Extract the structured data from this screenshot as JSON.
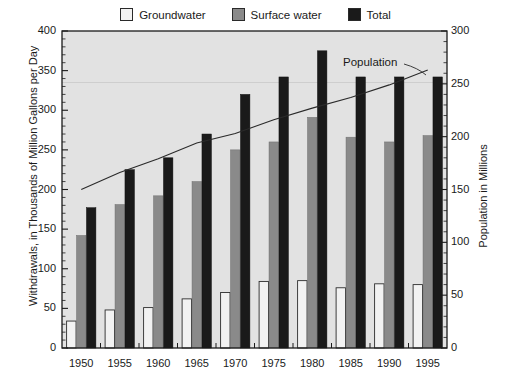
{
  "chart_data": {
    "type": "bar",
    "title": "",
    "subtitle": "",
    "xlabel": "",
    "ylabel": "Withdrawals, in Thousands of Million Gallons per Day",
    "y2label": "Population in Millions",
    "categories": [
      "1950",
      "1955",
      "1960",
      "1965",
      "1970",
      "1975",
      "1980",
      "1985",
      "1990",
      "1995"
    ],
    "ylim": [
      0,
      400
    ],
    "y2lim": [
      0,
      300
    ],
    "yticks": [
      0,
      50,
      100,
      150,
      200,
      250,
      300,
      350,
      400
    ],
    "y2ticks": [
      0,
      50,
      100,
      150,
      200,
      250,
      300
    ],
    "yminor_step": 10,
    "grid": "single faint horizontal line at y=335 (left axis)",
    "legend_position": "top-center",
    "plot_background": "#e2e2e2",
    "series": [
      {
        "name": "Groundwater",
        "axis": "left",
        "type": "bar",
        "color": "#f2f2f2",
        "values": [
          34,
          48,
          51,
          62,
          70,
          84,
          85,
          76,
          81,
          80
        ]
      },
      {
        "name": "Surface water",
        "axis": "left",
        "type": "bar",
        "color": "#8a8a8a",
        "values": [
          142,
          181,
          192,
          210,
          250,
          260,
          291,
          266,
          260,
          268
        ]
      },
      {
        "name": "Total",
        "axis": "left",
        "type": "bar",
        "color": "#1a1a1a",
        "values": [
          177,
          225,
          240,
          270,
          320,
          342,
          375,
          342,
          342,
          342
        ]
      },
      {
        "name": "Population",
        "axis": "right",
        "type": "line",
        "color": "#2a2a2a",
        "values": [
          150,
          166,
          179,
          194,
          203,
          216,
          227,
          237,
          249,
          263
        ]
      }
    ],
    "annotations": [
      {
        "text": "Population",
        "target_series": "Population"
      }
    ]
  },
  "legend": {
    "entries": [
      {
        "label": "Groundwater",
        "swatch": "#f2f2f2"
      },
      {
        "label": "Surface water",
        "swatch": "#8a8a8a"
      },
      {
        "label": "Total",
        "swatch": "#1a1a1a"
      }
    ]
  },
  "axes": {
    "left_title": "Withdrawals, in Thousands of Million Gallons per Day",
    "right_title": "Population in Millions",
    "left_ticks": [
      "0",
      "50",
      "100",
      "150",
      "200",
      "250",
      "300",
      "350",
      "400"
    ],
    "right_ticks": [
      "0",
      "50",
      "100",
      "150",
      "200",
      "250",
      "300"
    ],
    "x_ticks": [
      "1950",
      "1955",
      "1960",
      "1965",
      "1970",
      "1975",
      "1980",
      "1985",
      "1990",
      "1995"
    ]
  },
  "annotation": {
    "population_label": "Population"
  }
}
